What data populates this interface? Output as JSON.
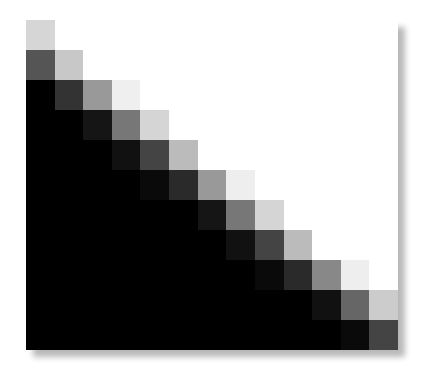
{
  "graphic": {
    "title": "",
    "rows": 11,
    "cols": 13,
    "background": "#ffffff",
    "shadow_color": "#c8c8c8",
    "cells": [
      [
        "#d6d6d6",
        "#ffffff",
        "#ffffff",
        "#ffffff",
        "#ffffff",
        "#ffffff",
        "#ffffff",
        "#ffffff",
        "#ffffff",
        "#ffffff",
        "#ffffff",
        "#ffffff",
        "#ffffff"
      ],
      [
        "#555555",
        "#c8c8c8",
        "#ffffff",
        "#ffffff",
        "#ffffff",
        "#ffffff",
        "#ffffff",
        "#ffffff",
        "#ffffff",
        "#ffffff",
        "#ffffff",
        "#ffffff",
        "#ffffff"
      ],
      [
        "#000000",
        "#333333",
        "#999999",
        "#efefef",
        "#ffffff",
        "#ffffff",
        "#ffffff",
        "#ffffff",
        "#ffffff",
        "#ffffff",
        "#ffffff",
        "#ffffff",
        "#ffffff"
      ],
      [
        "#000000",
        "#000000",
        "#151515",
        "#777777",
        "#d5d5d5",
        "#ffffff",
        "#ffffff",
        "#ffffff",
        "#ffffff",
        "#ffffff",
        "#ffffff",
        "#ffffff",
        "#ffffff"
      ],
      [
        "#000000",
        "#000000",
        "#000000",
        "#111111",
        "#444444",
        "#bbbbbb",
        "#ffffff",
        "#ffffff",
        "#ffffff",
        "#ffffff",
        "#ffffff",
        "#ffffff",
        "#ffffff"
      ],
      [
        "#000000",
        "#000000",
        "#000000",
        "#000000",
        "#0a0a0a",
        "#2a2a2a",
        "#999999",
        "#eeeeee",
        "#ffffff",
        "#ffffff",
        "#ffffff",
        "#ffffff",
        "#ffffff"
      ],
      [
        "#000000",
        "#000000",
        "#000000",
        "#000000",
        "#000000",
        "#000000",
        "#151515",
        "#777777",
        "#d5d5d5",
        "#ffffff",
        "#ffffff",
        "#ffffff",
        "#ffffff"
      ],
      [
        "#000000",
        "#000000",
        "#000000",
        "#000000",
        "#000000",
        "#000000",
        "#000000",
        "#111111",
        "#444444",
        "#bbbbbb",
        "#ffffff",
        "#ffffff",
        "#ffffff"
      ],
      [
        "#000000",
        "#000000",
        "#000000",
        "#000000",
        "#000000",
        "#000000",
        "#000000",
        "#000000",
        "#0a0a0a",
        "#2a2a2a",
        "#888888",
        "#eeeeee",
        "#ffffff"
      ],
      [
        "#000000",
        "#000000",
        "#000000",
        "#000000",
        "#000000",
        "#000000",
        "#000000",
        "#000000",
        "#000000",
        "#000000",
        "#111111",
        "#666666",
        "#cccccc"
      ],
      [
        "#000000",
        "#000000",
        "#000000",
        "#000000",
        "#000000",
        "#000000",
        "#000000",
        "#000000",
        "#000000",
        "#000000",
        "#000000",
        "#0a0a0a",
        "#444444"
      ]
    ]
  }
}
